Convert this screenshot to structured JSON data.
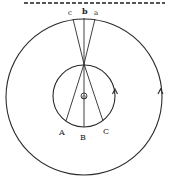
{
  "diagram": {
    "type": "geometry-figure",
    "stroke_color": "#2a2a2a",
    "background": "#ffffff",
    "center_label": "O",
    "top_labels": {
      "c": "c",
      "b": "b",
      "a": "a"
    },
    "bottom_labels": {
      "A": "A",
      "B": "B",
      "C": "C"
    },
    "outer_circle": {
      "cx": 84,
      "cy": 97,
      "r": 78,
      "arrow_direction": "counterclockwise"
    },
    "inner_circle": {
      "cx": 84,
      "cy": 96,
      "r": 31,
      "arrow_direction": "counterclockwise"
    },
    "dashed_line": {
      "y": 3,
      "x1": 24,
      "x2": 165
    }
  }
}
